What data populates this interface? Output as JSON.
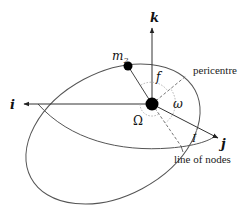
{
  "diagram": {
    "type": "orbital-elements",
    "axes": {
      "i": {
        "label": "i"
      },
      "j": {
        "label": "j"
      },
      "k": {
        "label": "k"
      }
    },
    "body": {
      "label": "m",
      "subscript": "2"
    },
    "angles": {
      "longitude_of_node": "Ω",
      "argument_of_pericentre": "ω",
      "true_anomaly": "f",
      "inclination": "I"
    },
    "annotations": {
      "pericentre": "pericentre",
      "line_of_nodes": "line of nodes"
    },
    "colors": {
      "line": "#555555",
      "dashed": "#666666",
      "dotted": "#aaaaaa",
      "mass": "#000000"
    }
  }
}
